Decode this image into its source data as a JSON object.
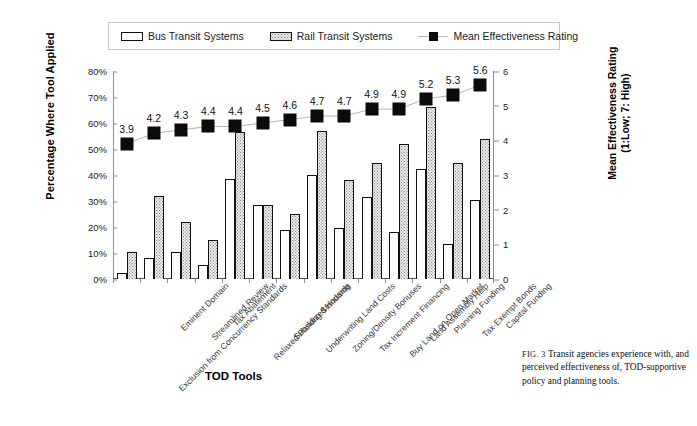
{
  "legend": {
    "items": [
      {
        "label": "Bus Transit Systems",
        "marker": "bus-swatch-icon"
      },
      {
        "label": "Rail Transit Systems",
        "marker": "rail-swatch-icon"
      },
      {
        "label": "Mean Effectiveness Rating",
        "marker": "mean-rating-swatch-icon"
      }
    ]
  },
  "caption": {
    "fig_number": "FIG. 3",
    "text": "Transit agencies experience with, and perceived effectiveness of, TOD-supportive policy and planning tools."
  },
  "chart_data": {
    "type": "bar",
    "title": "",
    "xlabel": "TOD Tools",
    "ylabel": "Percentage Where Tool Applied",
    "y2label_line1": "Mean Effectiveness Rating",
    "y2label_line2": "(1:Low; 7: High)",
    "grid": false,
    "legend_position": "top",
    "ylim": [
      0,
      80
    ],
    "yticks": [
      "0%",
      "10%",
      "20%",
      "30%",
      "40%",
      "50%",
      "60%",
      "70%",
      "80%"
    ],
    "ytickvals": [
      0,
      10,
      20,
      30,
      40,
      50,
      60,
      70,
      80
    ],
    "y2lim": [
      0,
      6
    ],
    "y2ticks": [
      "0",
      "1",
      "2",
      "3",
      "4",
      "5",
      "6"
    ],
    "y2tickvals": [
      0,
      1,
      2,
      3,
      4,
      5,
      6
    ],
    "categories": [
      "Exclusion from Concurrency Standards",
      "Eminent Domain",
      "Streamlined Review",
      "Tax Abatement",
      "Relaxed Parking Standards",
      "Subsidized Housing",
      "Underwriting Land Costs",
      "Zoning/Density Bonuses",
      "Tax Increment Financing",
      "Buy Land on Open Market",
      "Land Assembly Help",
      "Planning Funding",
      "Tax-Exempt Bonds",
      "Capital Funding"
    ],
    "series": [
      {
        "name": "Bus Transit Systems",
        "axis": "left",
        "values": [
          2.5,
          8.0,
          10.5,
          5.5,
          38.5,
          28.5,
          19.0,
          40.0,
          19.5,
          31.5,
          18.0,
          42.5,
          13.5,
          30.5
        ]
      },
      {
        "name": "Rail Transit Systems",
        "axis": "left",
        "values": [
          10.5,
          32.0,
          22.0,
          15.0,
          56.5,
          28.5,
          25.0,
          57.0,
          38.0,
          44.5,
          52.0,
          66.0,
          44.5,
          54.0
        ]
      },
      {
        "name": "Mean Effectiveness Rating",
        "axis": "right",
        "type": "line-marker",
        "values": [
          3.9,
          4.2,
          4.3,
          4.4,
          4.4,
          4.5,
          4.6,
          4.7,
          4.7,
          4.9,
          4.9,
          5.2,
          5.3,
          5.6
        ],
        "data_labels": [
          "3.9",
          "4.2",
          "4.3",
          "4.4",
          "4.4",
          "4.5",
          "4.6",
          "4.7",
          "4.7",
          "4.9",
          "4.9",
          "5.2",
          "5.3",
          "5.6"
        ]
      }
    ]
  },
  "colors": {
    "bus_fill": "#ffffff",
    "rail_fill": "#e9e9e9",
    "marker": "#0b0b0b",
    "line": "#b5b5b5",
    "axis": "#8d8d8d"
  }
}
